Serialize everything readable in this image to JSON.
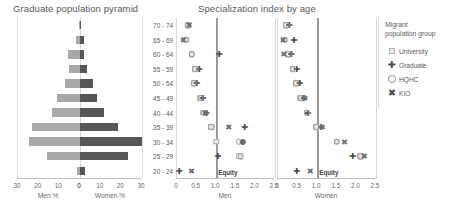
{
  "titles": {
    "pyramid": "Graduate population pyramid",
    "specialization": "Specialization index by age"
  },
  "legend": {
    "title_line1": "Migrant",
    "title_line2": "population group",
    "items": [
      {
        "label": "University",
        "icon": "square-icon",
        "glyph": ""
      },
      {
        "label": "Graduate",
        "icon": "plus-icon",
        "glyph": "✚"
      },
      {
        "label": "HQHC",
        "icon": "circle-icon",
        "glyph": ""
      },
      {
        "label": "KIO",
        "icon": "x-icon",
        "glyph": "✖"
      }
    ]
  },
  "chart_data": [
    {
      "type": "bar",
      "title": "Graduate population pyramid",
      "subtype": "population-pyramid",
      "categories": [
        "70 - 74",
        "65 - 69",
        "60 - 64",
        "55 - 59",
        "50 - 54",
        "45 - 49",
        "40 - 44",
        "35 - 39",
        "30 - 34",
        "25 - 29",
        "20 - 24"
      ],
      "series": [
        {
          "name": "Men %",
          "values": [
            0.6,
            2.0,
            6.0,
            5.5,
            7.5,
            11.0,
            13.5,
            23.0,
            24.5,
            16.0,
            1.5
          ],
          "color": "#a9a9a9"
        },
        {
          "name": "Women %",
          "values": [
            0.5,
            2.0,
            2.0,
            3.5,
            6.5,
            8.0,
            11.5,
            18.5,
            30.0,
            23.0,
            2.5
          ],
          "color": "#555759"
        }
      ],
      "xlabel_left": "Men %",
      "xlabel_right": "Women %",
      "xticks_left": [
        "30",
        "20",
        "10",
        "0"
      ],
      "xticks_right": [
        "0",
        "10",
        "20",
        "30"
      ],
      "xlim": [
        0,
        30
      ],
      "ylabel": "",
      "grid": false
    },
    {
      "type": "scatter",
      "title": "Specialization index by age",
      "panel": "Men",
      "xlabel": "Men",
      "ylabel": "",
      "xticks": [
        "0",
        "0.5",
        "1.0",
        "1.5",
        "2.0",
        "2.5"
      ],
      "xlim": [
        0,
        2.5
      ],
      "reference_line": {
        "value": 1.0,
        "label": "Equity"
      },
      "categories": [
        "70 - 74",
        "65 - 69",
        "60 - 64",
        "55 - 59",
        "50 - 54",
        "45 - 49",
        "40 - 44",
        "35 - 39",
        "30 - 34",
        "25 - 29",
        "20 - 24"
      ],
      "series": [
        {
          "name": "University",
          "values": [
            0.27,
            0.21,
            0.38,
            0.47,
            0.43,
            0.58,
            0.67,
            0.87,
            1.0,
            1.58,
            null
          ]
        },
        {
          "name": "Graduate",
          "values": [
            null,
            null,
            1.07,
            0.56,
            0.5,
            0.66,
            0.74,
            1.72,
            1.67,
            1.04,
            0.05
          ]
        },
        {
          "name": "HQHC",
          "values": [
            0.27,
            0.24,
            0.38,
            0.47,
            0.43,
            0.6,
            0.68,
            0.88,
            1.58,
            1.62,
            null
          ]
        },
        {
          "name": "KIO",
          "values": [
            0.31,
            0.16,
            null,
            null,
            null,
            null,
            0.73,
            1.32,
            1.68,
            null,
            0.37
          ]
        }
      ]
    },
    {
      "type": "scatter",
      "title": "Specialization index by age",
      "panel": "Women",
      "xlabel": "Women",
      "ylabel": "",
      "xticks": [
        "0",
        "0.5",
        "1.0",
        "1.5",
        "2.0",
        "2.5"
      ],
      "xlim": [
        0,
        2.5
      ],
      "reference_line": {
        "value": 1.0,
        "label": "Equity"
      },
      "categories": [
        "70 - 74",
        "65 - 69",
        "60 - 64",
        "55 - 59",
        "50 - 54",
        "45 - 49",
        "40 - 44",
        "35 - 39",
        "30 - 34",
        "25 - 29",
        "20 - 24"
      ],
      "series": [
        {
          "name": "University",
          "values": [
            0.2,
            0.16,
            0.25,
            0.38,
            0.46,
            0.56,
            0.73,
            0.97,
            1.5,
            2.12,
            null
          ]
        },
        {
          "name": "Graduate",
          "values": [
            0.28,
            0.4,
            0.33,
            0.47,
            0.55,
            0.66,
            0.76,
            1.1,
            null,
            1.9,
            0.47
          ]
        },
        {
          "name": "HQHC",
          "values": [
            0.21,
            0.17,
            0.26,
            0.38,
            0.46,
            0.58,
            0.73,
            0.98,
            1.5,
            2.1,
            null
          ]
        },
        {
          "name": "KIO",
          "values": [
            null,
            0.13,
            0.15,
            null,
            null,
            0.68,
            null,
            1.12,
            1.7,
            2.2,
            0.82
          ]
        }
      ]
    }
  ]
}
